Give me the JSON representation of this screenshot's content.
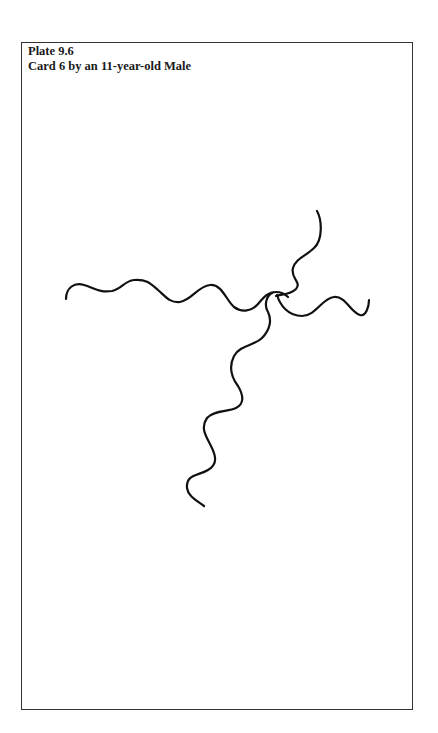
{
  "plate": {
    "number_label": "Plate 9.6",
    "title": "Card 6 by an 11-year-old Male"
  },
  "drawing": {
    "description": "Hand-drawn wavy lines forming a cross shape",
    "strokes": [
      "horizontal-wavy-line",
      "upper-right-wavy-line",
      "lower-vertical-wavy-line",
      "right-wavy-branch"
    ]
  }
}
